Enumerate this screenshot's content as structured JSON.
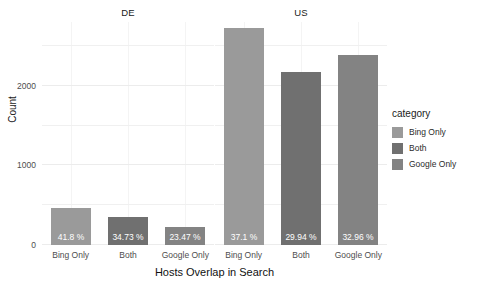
{
  "chart_data": {
    "type": "bar",
    "title": "",
    "xlabel": "Hosts Overlap in Search",
    "ylabel": "Count",
    "grid": true,
    "legend_position": "right",
    "legend_title": "category",
    "ylim": [
      0,
      2800
    ],
    "yticks": [
      0,
      1000,
      2000
    ],
    "ytick_labels": [
      "0",
      "1000",
      "2000"
    ],
    "categories": [
      "Bing Only",
      "Both",
      "Google Only"
    ],
    "facets": [
      {
        "name": "DE",
        "values": [
          460,
          355,
          225
        ],
        "data_labels": [
          "41.8 %",
          "34.73 %",
          "23.47 %"
        ]
      },
      {
        "name": "US",
        "values": [
          2720,
          2175,
          2390
        ],
        "data_labels": [
          "37.1 %",
          "29.94 %",
          "32.96 %"
        ]
      }
    ],
    "series_colors": {
      "Bing Only": "#9a9a9a",
      "Both": "#707070",
      "Google Only": "#838383"
    }
  },
  "legend": {
    "title": "category",
    "items": [
      {
        "label": "Bing Only",
        "color": "#9a9a9a"
      },
      {
        "label": "Both",
        "color": "#707070"
      },
      {
        "label": "Google Only",
        "color": "#838383"
      }
    ]
  },
  "axes": {
    "y_title": "Count",
    "x_title": "Hosts Overlap in Search",
    "y_ticks": [
      "2000",
      "1000",
      "0"
    ],
    "x_ticks_de": [
      "Bing Only",
      "Both",
      "Google Only"
    ],
    "x_ticks_us": [
      "Bing Only",
      "Both",
      "Google Only"
    ]
  },
  "strips": {
    "de": "DE",
    "us": "US"
  }
}
